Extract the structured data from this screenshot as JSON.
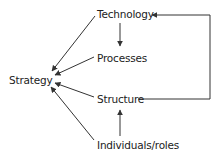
{
  "diagram": {
    "nodes": {
      "strategy": "Strategy",
      "technology": "Technology",
      "processes": "Processes",
      "structure": "Structure",
      "individuals": "Individuals/roles"
    },
    "edges": [
      {
        "from": "Technology",
        "to": "Strategy"
      },
      {
        "from": "Processes",
        "to": "Strategy"
      },
      {
        "from": "Structure",
        "to": "Strategy"
      },
      {
        "from": "Individuals/roles",
        "to": "Strategy"
      },
      {
        "from": "Technology",
        "to": "Processes"
      },
      {
        "from": "Individuals/roles",
        "to": "Structure"
      },
      {
        "from": "Structure",
        "to": "Technology"
      }
    ],
    "line_color": "#333333"
  }
}
